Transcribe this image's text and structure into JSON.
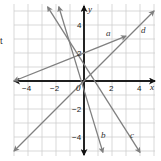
{
  "margin_text": "t",
  "chart_data": {
    "type": "line",
    "title": "",
    "xlabel": "x",
    "ylabel": "y",
    "xlim": [
      -5,
      5
    ],
    "ylim": [
      -5,
      5
    ],
    "grid": true,
    "origin_label": "0",
    "x_ticks": [
      -4,
      -2,
      2,
      4
    ],
    "x_tick_labels": [
      "−4",
      "−2",
      "2",
      "4"
    ],
    "y_ticks": [
      4,
      2,
      -2,
      -4
    ],
    "y_tick_labels": [
      "4",
      "2",
      "−2",
      "−4"
    ],
    "series": [
      {
        "name": "a",
        "equation": "y = 0.4x + 2",
        "x": [
          -5,
          3
        ],
        "y": [
          0,
          3.2
        ],
        "color": "#808080"
      },
      {
        "name": "b",
        "equation": "y = -3x",
        "x": [
          -1.8,
          1.35
        ],
        "y": [
          5.3,
          -5.1
        ],
        "color": "#808080"
      },
      {
        "name": "c",
        "equation": "y = -1.6x + 1",
        "x": [
          -2.6,
          4
        ],
        "y": [
          5.3,
          -5.1
        ],
        "color": "#808080"
      },
      {
        "name": "d",
        "equation": "y = x",
        "x": [
          -5,
          5
        ],
        "y": [
          -5,
          5
        ],
        "color": "#808080"
      }
    ]
  }
}
